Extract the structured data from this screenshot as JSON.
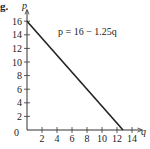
{
  "figure_label": "g.",
  "chart_data": {
    "type": "line",
    "title": "",
    "equation": "p = 16 − 1.25q",
    "xlabel": "q",
    "ylabel": "p",
    "x": [
      0,
      12.8
    ],
    "series": [
      {
        "name": "p = 16 − 1.25q",
        "values": [
          16,
          0
        ]
      }
    ],
    "xlim": [
      0,
      15
    ],
    "ylim": [
      0,
      17
    ],
    "x_ticks": [
      2,
      4,
      6,
      8,
      10,
      12,
      14
    ],
    "y_ticks": [
      2,
      4,
      6,
      8,
      10,
      12,
      14,
      16
    ],
    "origin_label": "0",
    "grid": false,
    "legend": "none"
  }
}
